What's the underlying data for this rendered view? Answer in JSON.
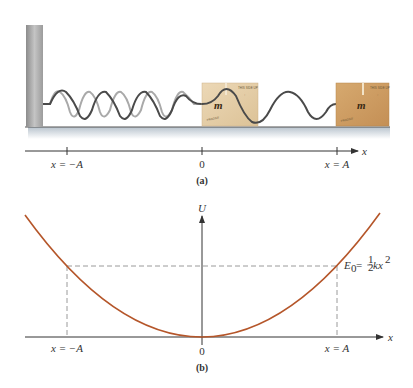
{
  "panel_a": {
    "caption": "(a)",
    "mass_label": "m",
    "axis_label": "x",
    "ticks": [
      {
        "label": "x = −A",
        "x": 67
      },
      {
        "label": "0",
        "x": 202
      },
      {
        "label": "x = A",
        "x": 337
      }
    ],
    "colors": {
      "wall": "#9a9a9a",
      "floor_shadow": "#c9d2da",
      "spring_dark": "#4a4a4a",
      "spring_light": "#a9a9a9",
      "box_light": "#e2cba5",
      "box_dark": "#c99a62"
    }
  },
  "panel_b": {
    "caption": "(b)",
    "y_axis_label": "U",
    "x_axis_label": "x",
    "energy_label_E": "E",
    "energy_label_sub": "0",
    "energy_label_eq": " = ",
    "energy_label_frac_num": "1",
    "energy_label_frac_den": "2",
    "energy_label_kx": "kx",
    "energy_label_exp": "2",
    "ticks": [
      {
        "label": "x = −A",
        "x": 67
      },
      {
        "label": "0",
        "x": 202
      },
      {
        "label": "x = A",
        "x": 337
      }
    ],
    "colors": {
      "curve": "#b5562a",
      "dashed": "#9a9a9a",
      "axis": "#333333"
    }
  }
}
